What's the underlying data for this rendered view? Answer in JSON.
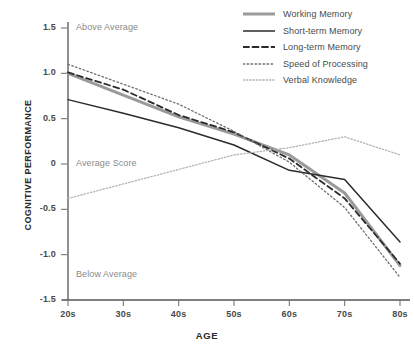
{
  "chart_data": {
    "type": "line",
    "title": "",
    "xlabel": "AGE",
    "ylabel": "COGNITIVE PERFORMANCE",
    "categories": [
      "20s",
      "30s",
      "40s",
      "50s",
      "60s",
      "70s",
      "80s"
    ],
    "xtick_labels": [
      "20s",
      "30s",
      "40s",
      "50s",
      "60s",
      "70s",
      "80s"
    ],
    "ytick_labels": [
      "1.5",
      "1.0",
      "0.5",
      "0",
      "-0.5",
      "-1.0",
      "-1.5"
    ],
    "ytick_values": [
      1.5,
      1.0,
      0.5,
      0,
      -0.5,
      -1.0,
      -1.5
    ],
    "ylim": [
      -1.5,
      1.5
    ],
    "grid": false,
    "legend_position": "top-right",
    "annotations": [
      {
        "text": "Above Average",
        "x": "20s",
        "y": 1.5
      },
      {
        "text": "Average Score",
        "x": "20s",
        "y": 0.0
      },
      {
        "text": "Below Average",
        "x": "20s",
        "y": -1.22
      }
    ],
    "series": [
      {
        "name": "Working Memory",
        "style": "thick-solid-gray",
        "color": "#9a9a9a",
        "values": [
          1.0,
          0.76,
          0.52,
          0.33,
          0.1,
          -0.32,
          -1.12
        ]
      },
      {
        "name": "Short-term Memory",
        "style": "solid",
        "color": "#2b2b2b",
        "values": [
          0.71,
          0.56,
          0.4,
          0.21,
          -0.07,
          -0.17,
          -0.86
        ]
      },
      {
        "name": "Long-term Memory",
        "style": "dashed",
        "color": "#2b2b2b",
        "values": [
          1.01,
          0.82,
          0.54,
          0.35,
          0.06,
          -0.38,
          -1.1
        ]
      },
      {
        "name": "Speed of Processing",
        "style": "dotted",
        "color": "#6e6e6e",
        "values": [
          1.1,
          0.88,
          0.66,
          0.36,
          0.02,
          -0.48,
          -1.25
        ]
      },
      {
        "name": "Verbal Knowledge",
        "style": "fine-dotted",
        "color": "#b4b4b4",
        "values": [
          -0.38,
          -0.22,
          -0.06,
          0.1,
          0.18,
          0.3,
          0.1
        ]
      }
    ]
  }
}
